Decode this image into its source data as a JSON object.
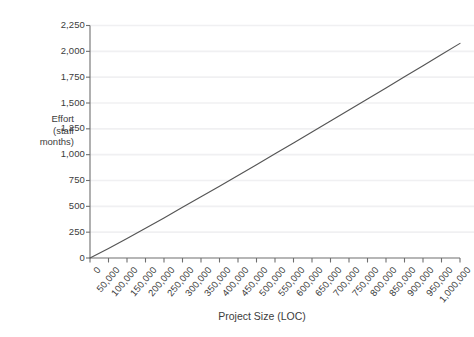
{
  "chart_data": {
    "type": "line",
    "title": "",
    "xlabel": "Project Size (LOC)",
    "ylabel": "Effort (staff months)",
    "ylabel_lines": [
      "Effort",
      "(staff",
      "months)"
    ],
    "xlim": [
      0,
      1000000
    ],
    "ylim": [
      0,
      2250
    ],
    "grid": true,
    "legend": false,
    "line_color": "#555555",
    "gridline_color": "#f0f0f2",
    "axis_color": "#6e6e6e",
    "x_tick_labels": [
      "0",
      "50,000",
      "100,000",
      "150,000",
      "200,000",
      "250,000",
      "300,000",
      "350,000",
      "400,000",
      "450,000",
      "500,000",
      "550,000",
      "600,000",
      "650,000",
      "700,000",
      "750,000",
      "800,000",
      "850,000",
      "900,000",
      "950,000",
      "1,000,000"
    ],
    "x_tick_values": [
      0,
      50000,
      100000,
      150000,
      200000,
      250000,
      300000,
      350000,
      400000,
      450000,
      500000,
      550000,
      600000,
      650000,
      700000,
      750000,
      800000,
      850000,
      900000,
      950000,
      1000000
    ],
    "y_tick_labels": [
      "0",
      "250",
      "500",
      "750",
      "1,000",
      "1,250",
      "1,500",
      "1,750",
      "2,000",
      "2,250"
    ],
    "y_tick_values": [
      0,
      250,
      500,
      750,
      1000,
      1250,
      1500,
      1750,
      2000,
      2250
    ],
    "series": [
      {
        "name": "Effort",
        "x": [
          0,
          50000,
          100000,
          150000,
          200000,
          250000,
          300000,
          350000,
          400000,
          450000,
          500000,
          550000,
          600000,
          650000,
          700000,
          750000,
          800000,
          850000,
          900000,
          950000,
          1000000
        ],
        "values": [
          0,
          92,
          189,
          288,
          388,
          490,
          592,
          695,
          799,
          903,
          1008,
          1113,
          1219,
          1325,
          1432,
          1538,
          1646,
          1753,
          1861,
          1969,
          2077
        ]
      }
    ]
  }
}
